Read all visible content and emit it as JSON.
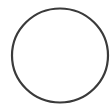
{
  "shape": {
    "type": "circle",
    "center_x": 60,
    "center_y": 55.5,
    "radius_x": 48,
    "radius_y": 47,
    "stroke_width": 2.2,
    "stroke_color": "#3a3a3a",
    "fill_color": "#ffffff"
  },
  "background_color": "#ffffff"
}
